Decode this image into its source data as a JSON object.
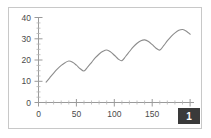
{
  "badge": {
    "label": "1",
    "name": "page-number-badge",
    "background": "#3a3a3a",
    "foreground": "#ffffff"
  },
  "frame": {
    "border_color": "#c8c8c8",
    "background": "#ffffff"
  },
  "chart_data": {
    "type": "line",
    "title": "",
    "xlabel": "",
    "ylabel": "",
    "xlim": [
      0,
      205
    ],
    "ylim": [
      0,
      41
    ],
    "grid": false,
    "legend": "none",
    "line_color": "#8c8c8c",
    "axis_color": "#9a9a9a",
    "xticks": [
      0,
      50,
      100,
      150,
      200
    ],
    "xtick_labels": [
      "0",
      "50",
      "100",
      "150",
      "200"
    ],
    "xticks_minor": [
      10,
      20,
      30,
      40,
      60,
      70,
      80,
      90,
      110,
      120,
      130,
      140,
      160,
      170,
      180,
      190,
      200
    ],
    "yticks": [
      0,
      10,
      20,
      30,
      40
    ],
    "ytick_labels": [
      "0",
      "10",
      "20",
      "30",
      "40"
    ],
    "yticks_minor": [
      2.5,
      5,
      7.5,
      12.5,
      15,
      17.5,
      22.5,
      25,
      27.5,
      32.5,
      35,
      37.5
    ],
    "series": [
      {
        "name": "series-1",
        "color": "#8c8c8c",
        "x": [
          10,
          15,
          20,
          25,
          30,
          35,
          40,
          45,
          50,
          55,
          60,
          65,
          70,
          75,
          80,
          85,
          90,
          95,
          100,
          105,
          110,
          115,
          120,
          125,
          130,
          135,
          140,
          145,
          150,
          155,
          160,
          165,
          170,
          175,
          180,
          185,
          190,
          195,
          200
        ],
        "y": [
          9.8,
          12.0,
          14.2,
          16.2,
          17.9,
          19.2,
          20.0,
          19.4,
          18.0,
          16.3,
          15.2,
          17.2,
          19.4,
          21.6,
          23.4,
          24.7,
          25.3,
          24.4,
          22.8,
          21.0,
          20.2,
          22.3,
          24.6,
          26.8,
          28.6,
          29.8,
          30.2,
          29.4,
          27.9,
          26.2,
          25.3,
          27.4,
          29.8,
          31.9,
          33.6,
          34.8,
          35.2,
          34.4,
          32.9
        ]
      }
    ]
  }
}
